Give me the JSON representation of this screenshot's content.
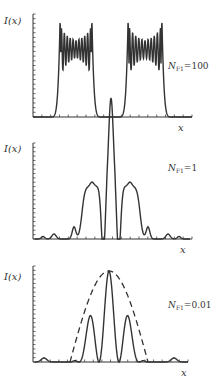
{
  "figure": {
    "panels": [
      {
        "y_label": "I(x)",
        "x_label": "x",
        "param_label": "N",
        "param_sub": "F1",
        "param_value": "=100"
      },
      {
        "y_label": "I(x)",
        "x_label": "x",
        "param_label": "N",
        "param_sub": "F1",
        "param_value": "=1"
      },
      {
        "y_label": "I(x)",
        "x_label": "x",
        "param_label": "N",
        "param_sub": "F1",
        "param_value": "=0.01"
      }
    ]
  },
  "chart_data": [
    {
      "type": "line",
      "title": "",
      "annotation": "N_F1=100",
      "xlabel": "x",
      "ylabel": "I(x)",
      "grid": false,
      "description": "Two flat-topped rectangular intensity blocks with rapid Fresnel ripple and edge overshoot",
      "series": [
        {
          "name": "I(x)",
          "x": [
            0,
            0.15,
            0.17,
            0.19,
            0.22,
            0.3,
            0.36,
            0.38,
            0.4,
            0.5,
            0.57,
            0.59,
            0.61,
            0.64,
            0.72,
            0.78,
            0.8,
            0.82,
            1.0
          ],
          "values": [
            0,
            0,
            0.3,
            1.0,
            0.7,
            0.8,
            1.0,
            0.3,
            0,
            0,
            0,
            0.3,
            1.0,
            0.7,
            0.8,
            1.0,
            0.3,
            0,
            0
          ]
        }
      ],
      "colors": {
        "line": "#333333"
      }
    },
    {
      "type": "line",
      "title": "",
      "annotation": "N_F1=1",
      "xlabel": "x",
      "ylabel": "I(x)",
      "grid": false,
      "series": [
        {
          "name": "I(x)",
          "x": [
            0,
            0.1,
            0.18,
            0.3,
            0.35,
            0.42,
            0.46,
            0.5,
            0.54,
            0.58,
            0.65,
            0.7,
            0.82,
            0.9,
            1.0
          ],
          "values": [
            0,
            0.02,
            0.05,
            0.15,
            0.62,
            0.62,
            0.2,
            1.0,
            0.2,
            0.62,
            0.62,
            0.15,
            0.05,
            0.02,
            0
          ]
        }
      ],
      "colors": {
        "line": "#333333"
      }
    },
    {
      "type": "line",
      "title": "",
      "annotation": "N_F1=0.01",
      "xlabel": "x",
      "ylabel": "I(x)",
      "grid": false,
      "series": [
        {
          "name": "I(x)",
          "style": "solid",
          "x": [
            0,
            0.08,
            0.3,
            0.37,
            0.42,
            0.5,
            0.58,
            0.63,
            0.7,
            0.92,
            1.0
          ],
          "values": [
            0,
            0.05,
            0.02,
            0.5,
            0,
            1.0,
            0,
            0.5,
            0.02,
            0.05,
            0
          ]
        },
        {
          "name": "envelope",
          "style": "dashed",
          "x": [
            0.25,
            0.5,
            0.75
          ],
          "values": [
            0,
            1.0,
            0
          ]
        }
      ],
      "colors": {
        "line": "#333333"
      }
    }
  ]
}
